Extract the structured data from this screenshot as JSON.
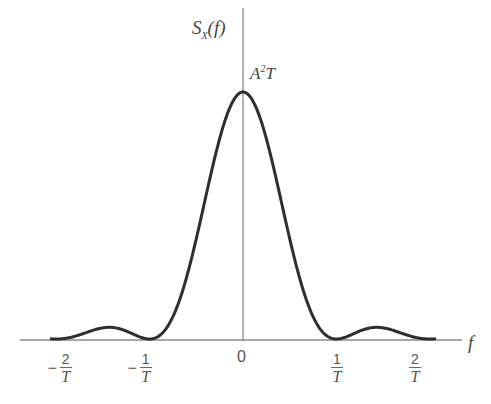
{
  "chart_data": {
    "type": "line",
    "title": "",
    "function": "S_X(f) = A^2 T sinc^2(fT)",
    "ylabel": {
      "main": "S",
      "sub": "X",
      "arg": "(f)"
    },
    "xlabel": "f",
    "peak_label": {
      "base": "A",
      "sup": "2",
      "tail": "T"
    },
    "xlim": [
      -2.35,
      2.35
    ],
    "visible_curve_range": [
      -2.05,
      2.05
    ],
    "x_ticks": [
      {
        "value": -2,
        "sign": "−",
        "num": "2",
        "den": "T"
      },
      {
        "value": -1,
        "sign": "−",
        "num": "1",
        "den": "T"
      },
      {
        "value": 0,
        "label": "0"
      },
      {
        "value": 1,
        "sign": "",
        "num": "1",
        "den": "T"
      },
      {
        "value": 2,
        "sign": "",
        "num": "2",
        "den": "T"
      }
    ],
    "x_units": "1/T",
    "y_peak": 1.0,
    "y_units": "A^2 T",
    "sample_points": [
      {
        "x": -2.0,
        "y": 0.0
      },
      {
        "x": -1.5,
        "y": 0.045
      },
      {
        "x": -1.0,
        "y": 0.0
      },
      {
        "x": -0.5,
        "y": 0.405
      },
      {
        "x": 0.0,
        "y": 1.0
      },
      {
        "x": 0.5,
        "y": 0.405
      },
      {
        "x": 1.0,
        "y": 0.0
      },
      {
        "x": 1.5,
        "y": 0.045
      },
      {
        "x": 2.0,
        "y": 0.0
      }
    ],
    "grid": false,
    "legend": null,
    "colors": {
      "curve": "#2e2e2e",
      "axes": "#8a8a8a"
    }
  }
}
